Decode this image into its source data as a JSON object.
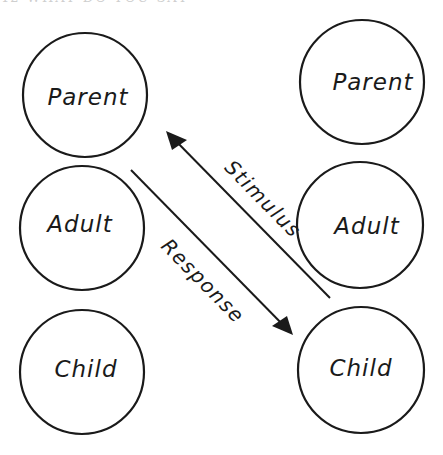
{
  "header": {
    "text": "42  WHAT DO YOU SAY"
  },
  "diagram": {
    "type": "transactional-analysis",
    "left_person": {
      "states": [
        {
          "label": "Parent",
          "cx": 85,
          "cy": 95,
          "r": 62
        },
        {
          "label": "Adult",
          "cx": 82,
          "cy": 228,
          "r": 62
        },
        {
          "label": "Child",
          "cx": 82,
          "cy": 372,
          "r": 62
        }
      ]
    },
    "right_person": {
      "states": [
        {
          "label": "Parent",
          "cx": 362,
          "cy": 82,
          "r": 62
        },
        {
          "label": "Adult",
          "cx": 360,
          "cy": 225,
          "r": 63
        },
        {
          "label": "Child",
          "cx": 361,
          "cy": 370,
          "r": 63
        }
      ]
    },
    "arrows": [
      {
        "label": "Stimulus",
        "from": [
          330,
          298
        ],
        "to": [
          166,
          131
        ]
      },
      {
        "label": "Response",
        "from": [
          131,
          170
        ],
        "to": [
          293,
          335
        ]
      }
    ],
    "colors": {
      "ink": "#1a1a1a",
      "background": "#ffffff"
    }
  }
}
